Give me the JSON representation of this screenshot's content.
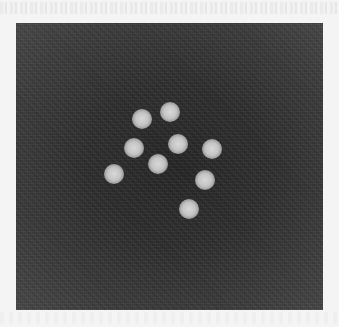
{
  "image": {
    "description": "Grayscale micrograph: dark noisy background with nine bright circular particles clustered near center",
    "background_color": "#2e2e2e",
    "particle_color": "#d0d0d0",
    "particles": [
      {
        "x": 142,
        "y": 119
      },
      {
        "x": 170,
        "y": 112
      },
      {
        "x": 134,
        "y": 148
      },
      {
        "x": 178,
        "y": 144
      },
      {
        "x": 212,
        "y": 149
      },
      {
        "x": 158,
        "y": 164
      },
      {
        "x": 114,
        "y": 174
      },
      {
        "x": 205,
        "y": 180
      },
      {
        "x": 189,
        "y": 209
      }
    ],
    "particle_count": 9
  }
}
